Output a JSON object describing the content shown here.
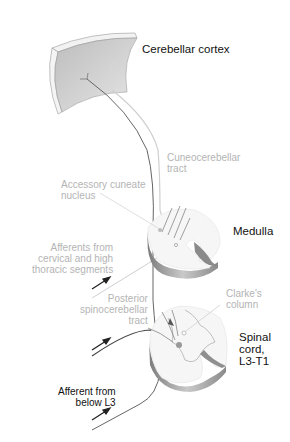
{
  "diagram": {
    "labels": {
      "cerebellar_cortex": "Cerebellar cortex",
      "cuneocerebellar_tract": "Cuneocerebellar\ntract",
      "accessory_cuneate_nucleus": "Accessory cuneate\nnucleus",
      "medulla": "Medulla",
      "afferents_cervical": "Afferents from\ncervical and high\nthoracic segments",
      "posterior_spinocerebellar_tract": "Posterior\nspinocerebellar\ntract",
      "clarkes_column": "Clarke's\ncolumn",
      "spinal_cord": "Spinal\ncord,\nL3-T1",
      "afferent_below_l3": "Afferent from\nbelow L3"
    },
    "colors": {
      "dark_label": "#111111",
      "light_label": "#b4b4b4",
      "tissue_fill": "#eeeeee",
      "tissue_shade": "#9a9a9a",
      "tract_dark": "#555555",
      "tract_light": "#c8c8c8"
    }
  }
}
